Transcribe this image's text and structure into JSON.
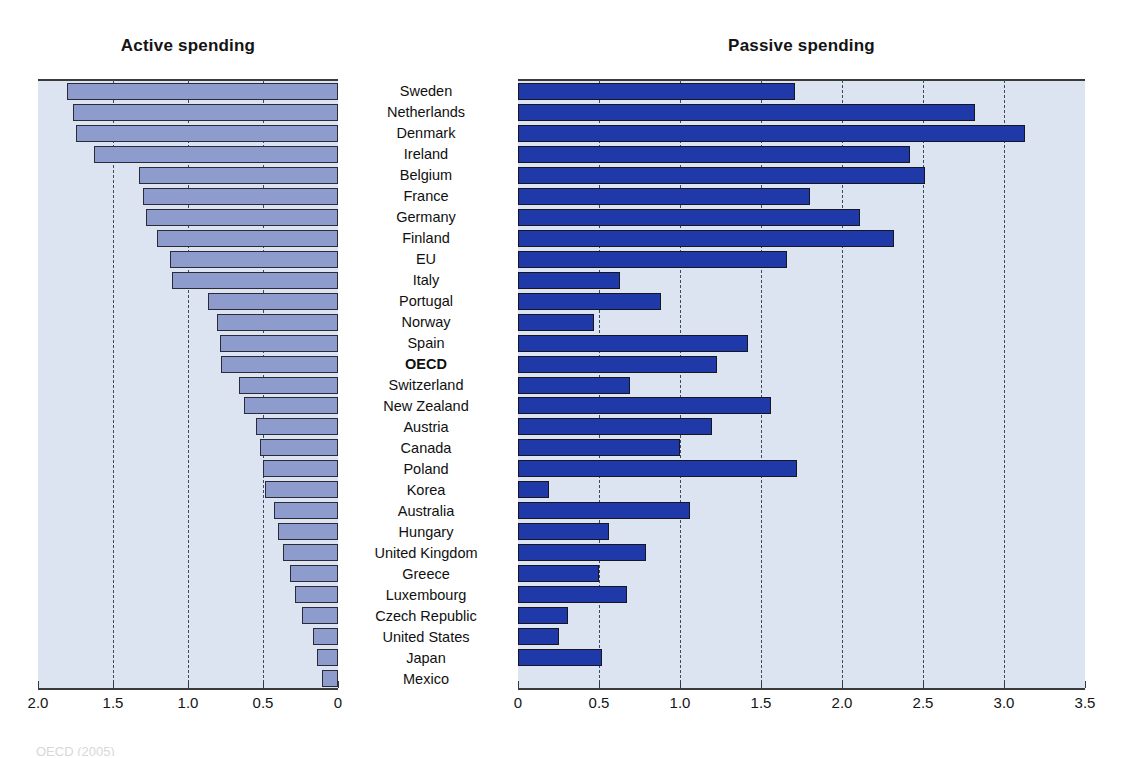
{
  "figure": {
    "width": 1126,
    "height": 758,
    "background": "#ffffff",
    "panel_background": "#dce4f2",
    "active_bar_color": "#8e9ccd",
    "passive_bar_color": "#2039a8",
    "bar_border_color": "#2b2b38",
    "gridline_color": "#3b4a63",
    "axis_color": "#3a3a3a",
    "footer_note": "OECD (2005)"
  },
  "panels": {
    "active": {
      "title": "Active spending"
    },
    "passive": {
      "title": "Passive spending"
    }
  },
  "axes": {
    "active": {
      "reversed": true,
      "min": 0,
      "max": 2.0,
      "ticks": [
        2.0,
        1.5,
        1.0,
        0.5,
        0
      ],
      "tick_labels": [
        "2.0",
        "1.5",
        "1.0",
        "0.5",
        "0"
      ],
      "gridlines": [
        1.5,
        1.0,
        0.5
      ]
    },
    "passive": {
      "reversed": false,
      "min": 0,
      "max": 3.5,
      "ticks": [
        0,
        0.5,
        1.0,
        1.5,
        2.0,
        2.5,
        3.0,
        3.5
      ],
      "tick_labels": [
        "0",
        "0.5",
        "1.0",
        "1.5",
        "2.0",
        "2.5",
        "3.0",
        "3.5"
      ],
      "gridlines": [
        0.5,
        1.0,
        1.5,
        2.0,
        2.5,
        3.0
      ]
    }
  },
  "chart_data": {
    "type": "bar",
    "orientation": "horizontal",
    "layout": "back-to-back dual panel (left axis reversed)",
    "xlabel": "",
    "ylabel": "",
    "grid": true,
    "legend_position": "none",
    "categories": [
      "Sweden",
      "Netherlands",
      "Denmark",
      "Ireland",
      "Belgium",
      "France",
      "Germany",
      "Finland",
      "EU",
      "Italy",
      "Portugal",
      "Norway",
      "Spain",
      "OECD",
      "Switzerland",
      "New Zealand",
      "Austria",
      "Canada",
      "Poland",
      "Korea",
      "Australia",
      "Hungary",
      "United Kingdom",
      "Greece",
      "Luxembourg",
      "Czech Republic",
      "United States",
      "Japan",
      "Mexico"
    ],
    "highlighted_category": "OECD",
    "series": [
      {
        "name": "Active spending",
        "panel": "left",
        "axis_range": [
          0,
          2.0
        ],
        "color": "#8e9ccd",
        "values": [
          1.81,
          1.77,
          1.75,
          1.63,
          1.33,
          1.3,
          1.28,
          1.21,
          1.12,
          1.11,
          0.87,
          0.81,
          0.79,
          0.78,
          0.66,
          0.63,
          0.55,
          0.52,
          0.5,
          0.49,
          0.43,
          0.4,
          0.37,
          0.32,
          0.29,
          0.24,
          0.17,
          0.14,
          0.11
        ]
      },
      {
        "name": "Passive spending",
        "panel": "right",
        "axis_range": [
          0,
          3.5
        ],
        "color": "#2039a8",
        "values": [
          1.71,
          2.82,
          3.13,
          2.42,
          2.51,
          1.8,
          2.11,
          2.32,
          1.66,
          0.63,
          0.88,
          0.47,
          1.42,
          1.23,
          0.69,
          1.56,
          1.2,
          1.0,
          1.72,
          0.19,
          1.06,
          0.56,
          0.79,
          0.5,
          0.67,
          0.31,
          0.25,
          0.52,
          null
        ]
      }
    ]
  }
}
